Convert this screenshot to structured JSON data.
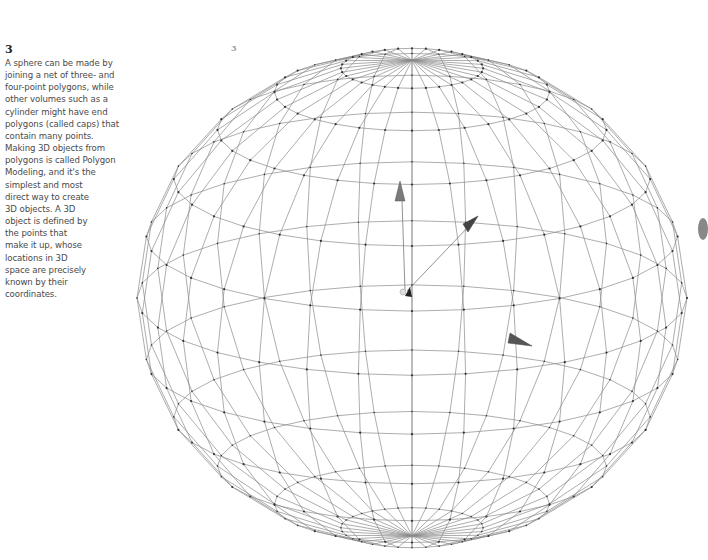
{
  "caption": {
    "number": "3",
    "text": "A sphere can be made by\njoining a net of three- and\nfour-point polygons, while\nother volumes such as a\ncylinder might have end\npolygons (called caps) that\ncontain many points.\nMaking 3D objects from\npolygons is called Polygon\nModeling, and it's the\nsimplest and most\ndirect way to create\n3D objects. A 3D\nobject is defined by\nthe points that\nmake it up, whose\nlocations in 3D\nspace are precisely\nknown by their\ncoordinates."
  },
  "figure": {
    "label": "3",
    "type": "wireframe-sphere",
    "center": [
      412,
      298
    ],
    "radius": [
      275,
      250
    ],
    "meridians": 32,
    "parallels": 12,
    "tilt_deg": 18,
    "line_color": "#8a8a8a",
    "vertex_color": "#333333",
    "poles": [
      [
        396,
        64
      ],
      [
        410,
        433
      ]
    ],
    "axis_markers": [
      {
        "name": "y-axis-cone",
        "at": [
          400,
          193
        ]
      },
      {
        "name": "z-axis-cone",
        "at": [
          470,
          225
        ]
      },
      {
        "name": "origin-marker",
        "at": [
          407,
          291
        ]
      },
      {
        "name": "x-axis-cone",
        "at": [
          518,
          341
        ]
      }
    ]
  }
}
